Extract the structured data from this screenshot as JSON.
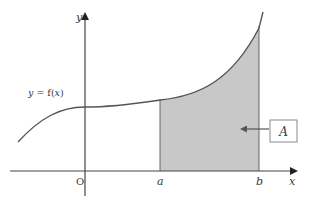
{
  "diagram": {
    "type": "area-under-curve",
    "axes": {
      "y_label": "y",
      "x_label": "x",
      "origin_label": "O"
    },
    "curve": {
      "label": "y = f(x)",
      "label_parts": {
        "y": "y",
        "eq": " = f(",
        "x": "x",
        "close": ")"
      }
    },
    "bounds": {
      "lower_label": "a",
      "upper_label": "b"
    },
    "region": {
      "label": "A",
      "fill_color": "#c8c8c8"
    },
    "colors": {
      "line": "#555555",
      "shade": "#c8c8c8",
      "text": "#3a3a3a"
    }
  }
}
